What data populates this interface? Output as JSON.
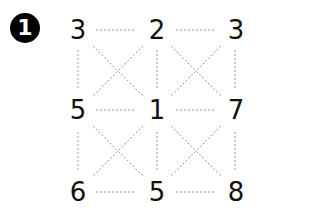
{
  "badge": {
    "label": "1"
  },
  "grid": {
    "rows": [
      [
        "3",
        "2",
        "3"
      ],
      [
        "5",
        "1",
        "7"
      ],
      [
        "6",
        "5",
        "8"
      ]
    ]
  },
  "colors": {
    "line": "#9a9a9a",
    "text": "#111111",
    "badge": "#000000"
  }
}
